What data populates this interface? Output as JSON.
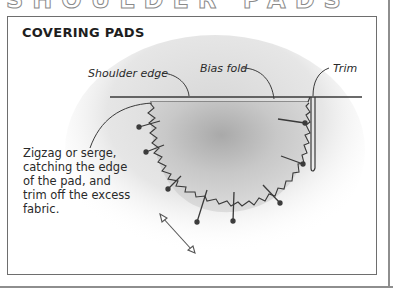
{
  "page": {
    "heading_partial": "SHOULDER PADS"
  },
  "figure": {
    "title": "COVERING PADS",
    "labels": {
      "shoulder_edge": "Shoulder edge",
      "bias_fold": "Bias fold",
      "trim": "Trim"
    },
    "note": "Zigzag or serge, catching the edge of the pad, and trim off the excess fabric.",
    "icons": {
      "grain_arrow": "double-headed-arrow"
    },
    "colors": {
      "line": "#3a3a3a",
      "frame": "#8e8e8e",
      "panel_border": "#6e6e6e"
    }
  }
}
